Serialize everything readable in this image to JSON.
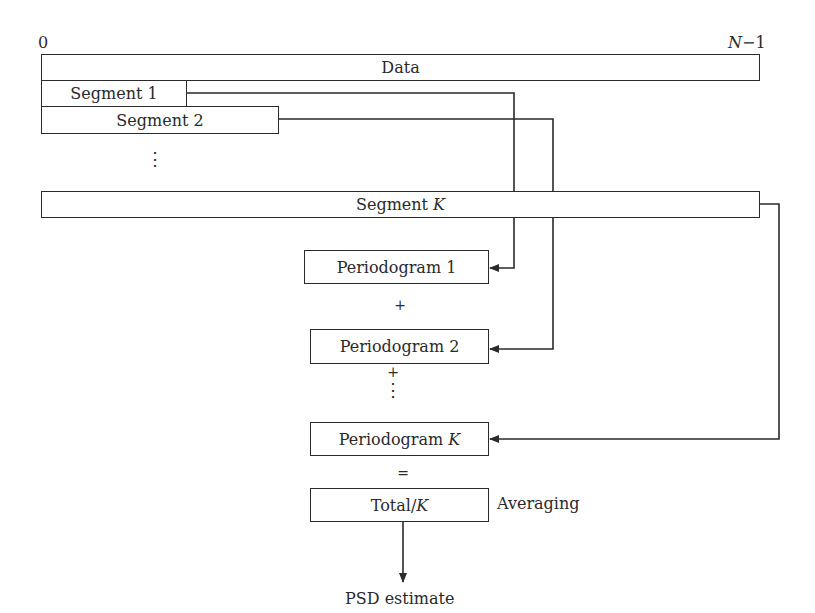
{
  "axis": {
    "start_label": "0",
    "end_label_var": "N",
    "end_label_suffix": "−1"
  },
  "data_bar": {
    "label": "Data"
  },
  "segments": [
    {
      "label": "Segment 1"
    },
    {
      "label": "Segment 2"
    },
    {
      "label_prefix": "Segment ",
      "label_var": "K"
    }
  ],
  "segment_ellipsis": "⋮",
  "periodograms": [
    {
      "label": "Periodogram 1"
    },
    {
      "label": "Periodogram 2"
    },
    {
      "label_prefix": "Periodogram ",
      "label_var": "K"
    }
  ],
  "operators": {
    "plus_1": "+",
    "plus_2": "+",
    "ellipsis": "⋮",
    "equals": "="
  },
  "total": {
    "label_prefix": "Total/",
    "label_var": "K",
    "side_label": "Averaging"
  },
  "output": {
    "label": "PSD estimate"
  },
  "colors": {
    "line": "#2a2a2a",
    "background": "#ffffff"
  }
}
